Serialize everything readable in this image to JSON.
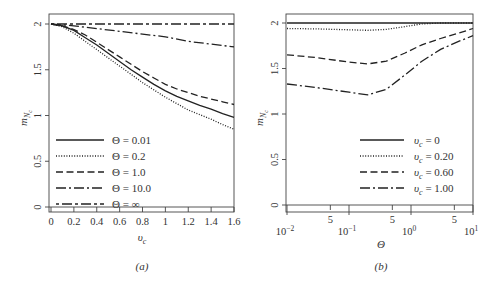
{
  "chart_data": [
    {
      "type": "line",
      "panel": "a",
      "caption": "(a)",
      "xlabel": "υc",
      "ylabel": "mNc",
      "xlim": [
        0,
        1.6
      ],
      "ylim": [
        0,
        2.1
      ],
      "x_scale": "linear",
      "xticks": [
        0,
        0.2,
        0.4,
        0.6,
        0.8,
        1,
        1.2,
        1.4,
        1.6
      ],
      "xtick_labels": [
        "0",
        "0.2",
        "0.4",
        "0.6",
        "0.8",
        "1",
        "1.2",
        "1.4",
        "1.6"
      ],
      "yticks": [
        0,
        0.5,
        1,
        1.5,
        2
      ],
      "ytick_labels": [
        "0",
        "0.5",
        "1",
        "1.5",
        "2"
      ],
      "legend_position": "bottom-left",
      "series": [
        {
          "name": "Θ = 0.01",
          "style": "solid",
          "x": [
            0,
            0.1,
            0.2,
            0.3,
            0.4,
            0.5,
            0.6,
            0.7,
            0.8,
            0.9,
            1.0,
            1.1,
            1.2,
            1.3,
            1.4,
            1.5,
            1.6
          ],
          "y": [
            2.0,
            1.98,
            1.93,
            1.85,
            1.77,
            1.68,
            1.59,
            1.5,
            1.42,
            1.34,
            1.27,
            1.21,
            1.16,
            1.11,
            1.07,
            1.02,
            0.98
          ]
        },
        {
          "name": "Θ = 0.2",
          "style": "dotted",
          "x": [
            0,
            0.1,
            0.2,
            0.3,
            0.4,
            0.5,
            0.6,
            0.7,
            0.8,
            0.9,
            1.0,
            1.1,
            1.2,
            1.3,
            1.4,
            1.5,
            1.6
          ],
          "y": [
            2.0,
            1.97,
            1.9,
            1.81,
            1.72,
            1.63,
            1.54,
            1.45,
            1.36,
            1.28,
            1.2,
            1.13,
            1.06,
            1.01,
            0.96,
            0.9,
            0.85
          ]
        },
        {
          "name": "Θ = 1.0",
          "style": "dashed",
          "x": [
            0,
            0.1,
            0.2,
            0.3,
            0.4,
            0.5,
            0.6,
            0.7,
            0.8,
            0.9,
            1.0,
            1.1,
            1.2,
            1.3,
            1.4,
            1.5,
            1.6
          ],
          "y": [
            2.0,
            1.98,
            1.94,
            1.88,
            1.8,
            1.72,
            1.64,
            1.56,
            1.48,
            1.41,
            1.34,
            1.29,
            1.25,
            1.21,
            1.18,
            1.15,
            1.12
          ]
        },
        {
          "name": "Θ = 10.0",
          "style": "dashdot",
          "x": [
            0,
            0.2,
            0.4,
            0.6,
            0.8,
            1.0,
            1.2,
            1.4,
            1.6
          ],
          "y": [
            2.0,
            1.98,
            1.95,
            1.92,
            1.89,
            1.86,
            1.81,
            1.78,
            1.75
          ]
        },
        {
          "name": "Θ = ∞",
          "style": "dashdotdot",
          "x": [
            0,
            1.6
          ],
          "y": [
            2.0,
            2.0
          ]
        }
      ]
    },
    {
      "type": "line",
      "panel": "b",
      "caption": "(b)",
      "xlabel": "Θ",
      "ylabel": "mNc",
      "xlim": [
        0.01,
        10
      ],
      "ylim": [
        0,
        2.1
      ],
      "x_scale": "log",
      "xticks_major": [
        0.01,
        0.1,
        1,
        10
      ],
      "xtick_major_labels": [
        [
          "10",
          "−2"
        ],
        [
          "10",
          "−1"
        ],
        [
          "10",
          "0"
        ],
        [
          "10",
          "1"
        ]
      ],
      "xticks_minor": [
        0.05,
        0.5,
        5
      ],
      "xtick_minor_labels": [
        "5",
        "5",
        "5"
      ],
      "yticks": [
        0,
        0.5,
        1,
        1.5,
        2
      ],
      "ytick_labels": [
        "0",
        "0.5",
        "1",
        "1.5",
        "2"
      ],
      "legend_position": "bottom-right",
      "series": [
        {
          "name": "υc = 0",
          "style": "solid",
          "x": [
            0.01,
            10
          ],
          "y": [
            2.0,
            2.0
          ]
        },
        {
          "name": "υc = 0.20",
          "style": "dotted",
          "x": [
            0.01,
            0.03,
            0.1,
            0.2,
            0.4,
            0.8,
            1.5,
            3,
            10
          ],
          "y": [
            1.94,
            1.935,
            1.925,
            1.92,
            1.93,
            1.96,
            1.99,
            2.0,
            2.0
          ]
        },
        {
          "name": "υc = 0.60",
          "style": "dashed",
          "x": [
            0.01,
            0.03,
            0.1,
            0.2,
            0.4,
            0.8,
            1.5,
            3,
            6,
            10
          ],
          "y": [
            1.65,
            1.62,
            1.57,
            1.55,
            1.58,
            1.67,
            1.76,
            1.83,
            1.89,
            1.94
          ]
        },
        {
          "name": "υc = 1.00",
          "style": "dashdot",
          "x": [
            0.01,
            0.03,
            0.1,
            0.2,
            0.4,
            0.8,
            1.5,
            3,
            6,
            10
          ],
          "y": [
            1.33,
            1.29,
            1.24,
            1.21,
            1.27,
            1.43,
            1.58,
            1.71,
            1.8,
            1.86
          ]
        }
      ]
    }
  ]
}
